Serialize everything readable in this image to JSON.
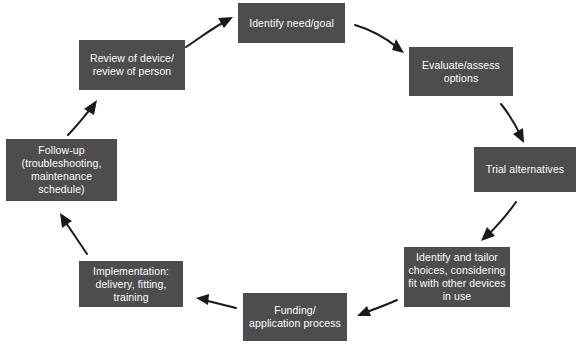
{
  "diagram": {
    "type": "cycle-flowchart",
    "direction": "clockwise",
    "colors": {
      "node_fill": "#4d4d4d",
      "node_text": "#ffffff",
      "arrow": "#1a1a1a",
      "background": "#ffffff"
    },
    "nodes": [
      {
        "id": "identify-need-goal",
        "label": "Identify need/goal",
        "x": 238,
        "y": 3,
        "width": 107,
        "height": 40
      },
      {
        "id": "evaluate-assess-options",
        "label": "Evaluate/assess\noptions",
        "x": 409,
        "y": 47,
        "width": 104,
        "height": 49
      },
      {
        "id": "trial-alternatives",
        "label": "Trial alternatives",
        "x": 474,
        "y": 147,
        "width": 102,
        "height": 45
      },
      {
        "id": "identify-and-tailor-choices",
        "label": "Identify and tailor\nchoices, considering\nfit with other devices\nin use",
        "x": 404,
        "y": 247,
        "width": 106,
        "height": 60
      },
      {
        "id": "funding-application-process",
        "label": "Funding/\napplication process",
        "x": 243,
        "y": 293,
        "width": 104,
        "height": 48
      },
      {
        "id": "implementation",
        "label": "Implementation:\ndelivery, fitting,\ntraining",
        "x": 79,
        "y": 261,
        "width": 104,
        "height": 46
      },
      {
        "id": "follow-up",
        "label": "Follow-up\n(troubleshooting,\nmaintenance\nschedule)",
        "x": 6,
        "y": 139,
        "width": 111,
        "height": 62
      },
      {
        "id": "review-of-device-person",
        "label": "Review of device/\nreview of person",
        "x": 79,
        "y": 40,
        "width": 106,
        "height": 50
      }
    ],
    "arrows": [
      {
        "id": "arrow-review-to-identify",
        "from": "review-of-device-person",
        "to": "identify-need-goal"
      },
      {
        "id": "arrow-identify-to-evaluate",
        "from": "identify-need-goal",
        "to": "evaluate-assess-options"
      },
      {
        "id": "arrow-evaluate-to-trial",
        "from": "evaluate-assess-options",
        "to": "trial-alternatives"
      },
      {
        "id": "arrow-trial-to-tailor",
        "from": "trial-alternatives",
        "to": "identify-and-tailor-choices"
      },
      {
        "id": "arrow-tailor-to-funding",
        "from": "identify-and-tailor-choices",
        "to": "funding-application-process"
      },
      {
        "id": "arrow-funding-to-implementation",
        "from": "funding-application-process",
        "to": "implementation"
      },
      {
        "id": "arrow-implementation-to-followup",
        "from": "implementation",
        "to": "follow-up"
      },
      {
        "id": "arrow-followup-to-review",
        "from": "follow-up",
        "to": "review-of-device-person"
      }
    ]
  }
}
